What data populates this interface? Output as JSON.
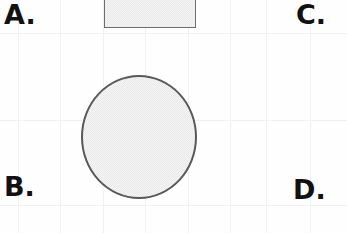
{
  "page": {
    "kind": "worksheet-figure",
    "width": 347,
    "height": 233,
    "background_color": "#fefefe",
    "grid_color": "#f1f1f2"
  },
  "labels": {
    "a": "A.",
    "b": "B.",
    "c": "C.",
    "d": "D."
  },
  "shapes": [
    {
      "name": "rectangle",
      "type": "rectangle",
      "fill_color": "#e9e9e9",
      "stroke_color": "#6d6d6d",
      "x": 104,
      "y": -18,
      "width": 90,
      "height": 45,
      "clipped_top": true
    },
    {
      "name": "circle",
      "type": "circle",
      "fill_color": "#e9e9e9",
      "stroke_color": "#595959",
      "center_x": 139,
      "center_y": 137,
      "diameter": 118
    }
  ],
  "grid": {
    "vertical_x": [
      18,
      60,
      103,
      145,
      188,
      230,
      266,
      310
    ],
    "horizontal_y": [
      33,
      120,
      205
    ]
  }
}
